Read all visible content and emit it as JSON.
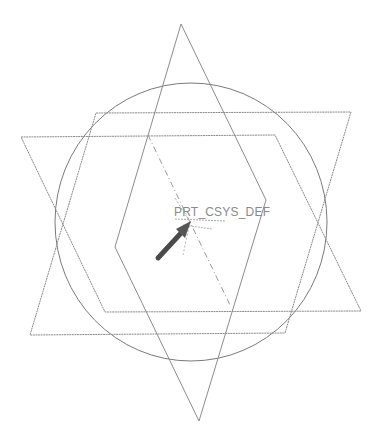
{
  "viewport": {
    "background": "#ffffff",
    "line_color": "#8c8c8c",
    "circle_color": "#7a7a7a",
    "arrow_color": "#4a4a4a"
  },
  "datum_csys": {
    "label": "PRT_CSYS_DEF",
    "label_color": "#8a8a8a"
  },
  "geometry": {
    "circle": {
      "cx": 191,
      "cy": 222,
      "rx": 136,
      "ry": 139
    },
    "plane_a": [
      [
        96,
        113
      ],
      [
        351,
        112
      ],
      [
        285,
        333
      ],
      [
        30,
        335
      ]
    ],
    "plane_b": [
      [
        21,
        137
      ],
      [
        275,
        135
      ],
      [
        361,
        311
      ],
      [
        105,
        312
      ]
    ],
    "rhombus": [
      [
        181,
        24
      ],
      [
        266,
        200
      ],
      [
        199,
        421
      ],
      [
        115,
        247
      ]
    ],
    "axis_dashed": [
      [
        148,
        135
      ],
      [
        230,
        305
      ]
    ],
    "arrow": {
      "from": [
        158,
        258
      ],
      "to": [
        190,
        222
      ]
    }
  }
}
